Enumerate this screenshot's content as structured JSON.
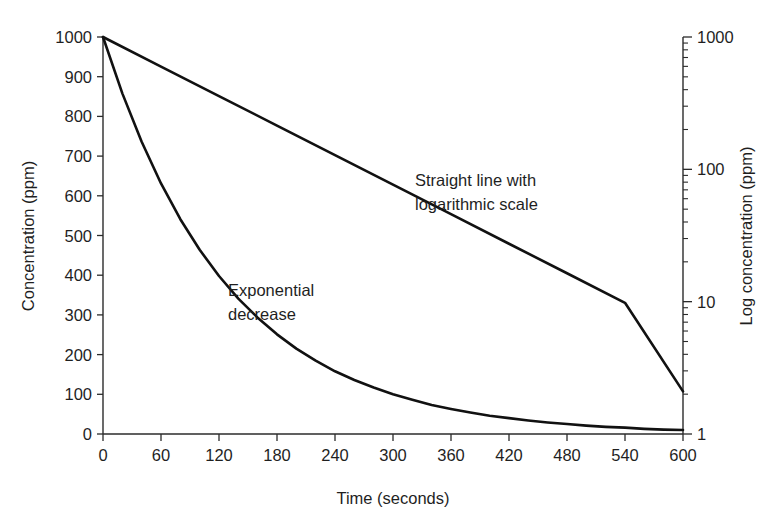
{
  "chart_data": {
    "type": "line",
    "title": "",
    "xlabel": "Time (seconds)",
    "ylabel": "Concentration (ppm)",
    "y2label": "Log concentration (ppm)",
    "xlim": [
      0,
      600
    ],
    "ylim": [
      0,
      1000
    ],
    "y2lim": [
      1,
      1000
    ],
    "y2scale": "log",
    "grid": false,
    "legend_position": "none",
    "xticks": [
      0,
      60,
      120,
      180,
      240,
      300,
      360,
      420,
      480,
      540,
      600
    ],
    "xtick_labels": [
      "0",
      "60",
      "120",
      "180",
      "240",
      "300",
      "360",
      "420",
      "480",
      "540",
      "600"
    ],
    "yticks": [
      0,
      100,
      200,
      300,
      400,
      500,
      600,
      700,
      800,
      900,
      1000
    ],
    "ytick_labels": [
      "0",
      "100",
      "200",
      "300",
      "400",
      "500",
      "600",
      "700",
      "800",
      "900",
      "1000"
    ],
    "y2ticks": [
      1,
      10,
      100,
      1000
    ],
    "y2tick_labels": [
      "1",
      "10",
      "100",
      "1000"
    ],
    "series": [
      {
        "name": "Exponential decrease",
        "axis": "left",
        "x": [
          0,
          20,
          40,
          60,
          80,
          100,
          120,
          140,
          160,
          180,
          200,
          220,
          240,
          260,
          280,
          300,
          320,
          340,
          360,
          380,
          400,
          420,
          440,
          460,
          480,
          500,
          520,
          540,
          560,
          580,
          600
        ],
        "values": [
          1000,
          858,
          736,
          631,
          541,
          464,
          398,
          341,
          293,
          251,
          215,
          185,
          158,
          136,
          117,
          100,
          86,
          73,
          63,
          54,
          46,
          40,
          34,
          29,
          25,
          21,
          18,
          16,
          13,
          11,
          10
        ]
      },
      {
        "name": "Straight line with logarithmic scale",
        "axis": "right",
        "x": [
          0,
          60,
          120,
          180,
          240,
          300,
          360,
          420,
          480,
          540,
          600
        ],
        "values": [
          1000,
          598,
          358,
          214,
          128,
          76.6,
          45.8,
          27.4,
          16.4,
          9.8,
          2.1
        ]
      }
    ],
    "annotations": [
      {
        "name": "straight-line-annotation",
        "line1": "Straight line with",
        "line2": "logarithmic scale",
        "x": 415,
        "y": 186
      },
      {
        "name": "exponential-annotation",
        "line1": "Exponential",
        "line2": "decrease",
        "x": 228,
        "y": 296
      }
    ]
  },
  "axes": {
    "left_title": "Concentration (ppm)",
    "right_title": "Log concentration (ppm)",
    "bottom_title": "Time (seconds)"
  }
}
